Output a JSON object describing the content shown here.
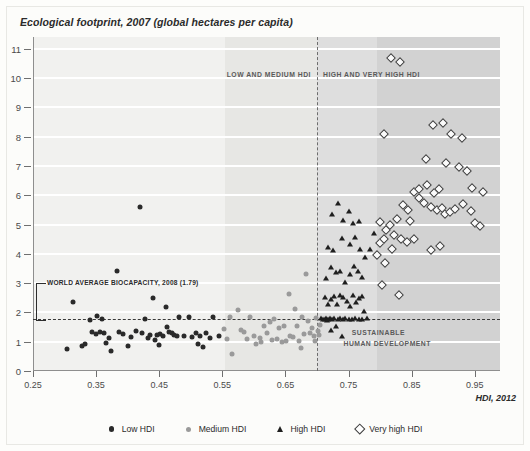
{
  "figure": {
    "title": "Ecological footprint, 2007 (global hectares per capita)",
    "xaxis_title": "HDI, 2012"
  },
  "annotations": {
    "low_medium_band": "LOW AND MEDIUM HDI",
    "high_veryhigh_band": "HIGH AND VERY HIGH HDI",
    "biocapacity": "WORLD AVERAGE BIOCAPACITY, 2008 (1.79)",
    "sustainable_line1": "SUSTAINABLE",
    "sustainable_line2": "HUMAN DEVELOPMENT"
  },
  "legend": [
    {
      "label": "Low HDI",
      "marker": "filled-circle-dark",
      "color": "#2a2a2a"
    },
    {
      "label": "Medium HDI",
      "marker": "filled-circle-gray",
      "color": "#9a9a9a"
    },
    {
      "label": "High HDI",
      "marker": "filled-triangle",
      "color": "#1f1f1f"
    },
    {
      "label": "Very high HDI",
      "marker": "open-diamond",
      "color": "#3c3c3c"
    }
  ],
  "chart_data": {
    "type": "scatter",
    "title": "Ecological footprint, 2007 (global hectares per capita)",
    "xlabel": "HDI, 2012",
    "ylabel": "Ecological footprint, 2007 (global hectares per capita)",
    "xlim": [
      0.25,
      0.99
    ],
    "ylim": [
      0,
      11.4
    ],
    "xticks": [
      0.25,
      0.35,
      0.45,
      0.55,
      0.65,
      0.75,
      0.85,
      0.95
    ],
    "xtick_labels": [
      "0.25",
      "0.35",
      "0.45",
      "0.55",
      "0.65",
      "0.75",
      "0.85",
      "0.95"
    ],
    "yticks": [
      0,
      1,
      2,
      3,
      4,
      5,
      6,
      7,
      8,
      9,
      10,
      11
    ],
    "ytick_labels": [
      "0",
      "1",
      "2",
      "3",
      "4",
      "5",
      "6",
      "7",
      "8",
      "9",
      "10",
      "11"
    ],
    "grid": "horizontal-white",
    "legend_position": "bottom-center",
    "reference_lines": [
      {
        "name": "world-average-biocapacity",
        "orientation": "horizontal",
        "value": 1.79,
        "label": "WORLD AVERAGE BIOCAPACITY, 2008 (1.79)",
        "style": "dashed"
      },
      {
        "name": "hdi-threshold",
        "orientation": "vertical",
        "value": 0.7,
        "label": "",
        "style": "dashed"
      }
    ],
    "shaded_bands": [
      {
        "name": "low-and-medium-hdi",
        "x_from": 0.555,
        "x_to": 0.7,
        "shade": "#e7e7e4"
      },
      {
        "name": "high-hdi",
        "x_from": 0.7,
        "x_to": 0.795,
        "shade": "#dedede"
      },
      {
        "name": "very-high-hdi",
        "x_from": 0.795,
        "x_to": 0.99,
        "shade": "#d2d2d2"
      }
    ],
    "series": [
      {
        "name": "Low HDI",
        "marker": "filled-circle-dark",
        "points": [
          [
            0.304,
            0.75
          ],
          [
            0.314,
            2.35
          ],
          [
            0.327,
            0.87
          ],
          [
            0.333,
            0.92
          ],
          [
            0.34,
            1.73
          ],
          [
            0.344,
            1.33
          ],
          [
            0.35,
            1.27
          ],
          [
            0.352,
            1.88
          ],
          [
            0.356,
            1.32
          ],
          [
            0.359,
            1.76
          ],
          [
            0.362,
            1.3
          ],
          [
            0.366,
            0.95
          ],
          [
            0.37,
            1.12
          ],
          [
            0.374,
            0.69
          ],
          [
            0.383,
            3.4
          ],
          [
            0.387,
            1.32
          ],
          [
            0.392,
            1.26
          ],
          [
            0.4,
            0.84
          ],
          [
            0.405,
            1.17
          ],
          [
            0.413,
            1.38
          ],
          [
            0.419,
            5.6
          ],
          [
            0.422,
            1.3
          ],
          [
            0.428,
            1.79
          ],
          [
            0.432,
            1.12
          ],
          [
            0.436,
            1.24
          ],
          [
            0.44,
            2.5
          ],
          [
            0.443,
            1.05
          ],
          [
            0.447,
            1.22
          ],
          [
            0.45,
            0.88
          ],
          [
            0.452,
            1.26
          ],
          [
            0.456,
            1.2
          ],
          [
            0.46,
            2.2
          ],
          [
            0.462,
            1.5
          ],
          [
            0.465,
            1.32
          ],
          [
            0.47,
            1.28
          ],
          [
            0.474,
            1.22
          ],
          [
            0.478,
            1.18
          ],
          [
            0.482,
            1.86
          ],
          [
            0.49,
            1.2
          ],
          [
            0.497,
            1.86
          ],
          [
            0.502,
            1.15
          ],
          [
            0.508,
            1.3
          ],
          [
            0.512,
            0.92
          ],
          [
            0.515,
            1.18
          ],
          [
            0.519,
            0.82
          ],
          [
            0.524,
            1.28
          ],
          [
            0.53,
            1.12
          ],
          [
            0.535,
            1.85
          ],
          [
            0.545,
            1.2
          ]
        ]
      },
      {
        "name": "Medium HDI",
        "marker": "filled-circle-gray",
        "points": [
          [
            0.552,
            1.45
          ],
          [
            0.558,
            1.1
          ],
          [
            0.562,
            1.85
          ],
          [
            0.566,
            0.57
          ],
          [
            0.575,
            2.08
          ],
          [
            0.58,
            1.4
          ],
          [
            0.584,
            1.32
          ],
          [
            0.589,
            1.1
          ],
          [
            0.594,
            1.84
          ],
          [
            0.6,
            1.2
          ],
          [
            0.604,
            0.93
          ],
          [
            0.609,
            1.12
          ],
          [
            0.612,
            1.0
          ],
          [
            0.616,
            1.55
          ],
          [
            0.62,
            1.3
          ],
          [
            0.625,
            1.66
          ],
          [
            0.629,
            1.05
          ],
          [
            0.632,
            1.78
          ],
          [
            0.636,
            1.08
          ],
          [
            0.64,
            1.48
          ],
          [
            0.644,
            0.98
          ],
          [
            0.647,
            1.55
          ],
          [
            0.651,
            1.02
          ],
          [
            0.655,
            2.62
          ],
          [
            0.658,
            1.2
          ],
          [
            0.662,
            1.15
          ],
          [
            0.665,
            2.1
          ],
          [
            0.668,
            1.52
          ],
          [
            0.671,
            1.02
          ],
          [
            0.674,
            0.78
          ],
          [
            0.677,
            1.84
          ],
          [
            0.68,
            1.26
          ],
          [
            0.683,
            3.3
          ],
          [
            0.686,
            1.7
          ],
          [
            0.689,
            1.28
          ],
          [
            0.692,
            1.46
          ],
          [
            0.695,
            1.18
          ],
          [
            0.697,
            1.02
          ],
          [
            0.699,
            1.8
          ],
          [
            0.701,
            1.36
          ],
          [
            0.703,
            1.24
          ],
          [
            0.705,
            1.58
          ]
        ]
      },
      {
        "name": "High HDI",
        "marker": "filled-triangle",
        "points": [
          [
            0.706,
            1.8
          ],
          [
            0.709,
            1.76
          ],
          [
            0.712,
            1.78
          ],
          [
            0.714,
            1.82
          ],
          [
            0.716,
            1.74
          ],
          [
            0.718,
            1.79
          ],
          [
            0.72,
            1.8
          ],
          [
            0.722,
            1.4
          ],
          [
            0.724,
            1.76
          ],
          [
            0.727,
            1.82
          ],
          [
            0.73,
            1.55
          ],
          [
            0.733,
            1.78
          ],
          [
            0.736,
            1.81
          ],
          [
            0.739,
            1.2
          ],
          [
            0.742,
            1.79
          ],
          [
            0.745,
            1.82
          ],
          [
            0.712,
            2.52
          ],
          [
            0.717,
            2.3
          ],
          [
            0.722,
            2.45
          ],
          [
            0.727,
            2.55
          ],
          [
            0.731,
            2.3
          ],
          [
            0.736,
            2.6
          ],
          [
            0.742,
            2.52
          ],
          [
            0.747,
            2.4
          ],
          [
            0.752,
            2.22
          ],
          [
            0.757,
            2.6
          ],
          [
            0.762,
            2.35
          ],
          [
            0.766,
            2.48
          ],
          [
            0.771,
            2.55
          ],
          [
            0.775,
            2.05
          ],
          [
            0.75,
            1.79
          ],
          [
            0.755,
            1.78
          ],
          [
            0.76,
            1.8
          ],
          [
            0.766,
            1.79
          ],
          [
            0.772,
            1.78
          ],
          [
            0.779,
            1.8
          ],
          [
            0.714,
            3.18
          ],
          [
            0.722,
            3.55
          ],
          [
            0.73,
            3.38
          ],
          [
            0.737,
            3.4
          ],
          [
            0.745,
            3.05
          ],
          [
            0.752,
            3.3
          ],
          [
            0.758,
            3.6
          ],
          [
            0.765,
            3.42
          ],
          [
            0.771,
            3.2
          ],
          [
            0.717,
            4.22
          ],
          [
            0.726,
            4.12
          ],
          [
            0.739,
            4.55
          ],
          [
            0.752,
            4.35
          ],
          [
            0.76,
            4.58
          ],
          [
            0.768,
            4.18
          ],
          [
            0.742,
            5.15
          ],
          [
            0.757,
            5.05
          ],
          [
            0.766,
            5.12
          ],
          [
            0.724,
            5.35
          ],
          [
            0.734,
            5.75
          ],
          [
            0.751,
            5.45
          ],
          [
            0.776,
            3.9
          ],
          [
            0.784,
            4.15
          ],
          [
            0.79,
            4.72
          ]
        ]
      },
      {
        "name": "Very high HDI",
        "marker": "open-diamond",
        "points": [
          [
            0.818,
            10.7
          ],
          [
            0.832,
            10.55
          ],
          [
            0.806,
            8.1
          ],
          [
            0.884,
            8.38
          ],
          [
            0.899,
            8.45
          ],
          [
            0.913,
            8.08
          ],
          [
            0.872,
            7.25
          ],
          [
            0.905,
            7.1
          ],
          [
            0.925,
            6.95
          ],
          [
            0.938,
            6.82
          ],
          [
            0.854,
            6.12
          ],
          [
            0.862,
            6.22
          ],
          [
            0.874,
            6.35
          ],
          [
            0.886,
            6.08
          ],
          [
            0.894,
            6.2
          ],
          [
            0.862,
            5.9
          ],
          [
            0.87,
            5.72
          ],
          [
            0.88,
            5.6
          ],
          [
            0.89,
            5.48
          ],
          [
            0.898,
            5.55
          ],
          [
            0.903,
            5.35
          ],
          [
            0.911,
            5.44
          ],
          [
            0.919,
            5.52
          ],
          [
            0.931,
            5.7
          ],
          [
            0.944,
            5.45
          ],
          [
            0.836,
            5.65
          ],
          [
            0.844,
            5.48
          ],
          [
            0.826,
            5.18
          ],
          [
            0.815,
            4.98
          ],
          [
            0.848,
            5.12
          ],
          [
            0.8,
            5.1
          ],
          [
            0.81,
            4.8
          ],
          [
            0.822,
            4.65
          ],
          [
            0.833,
            4.52
          ],
          [
            0.842,
            4.4
          ],
          [
            0.853,
            4.52
          ],
          [
            0.8,
            4.38
          ],
          [
            0.806,
            4.52
          ],
          [
            0.819,
            4.18
          ],
          [
            0.795,
            3.95
          ],
          [
            0.808,
            3.7
          ],
          [
            0.803,
            2.95
          ],
          [
            0.83,
            2.6
          ],
          [
            0.95,
            5.05
          ],
          [
            0.958,
            4.95
          ],
          [
            0.945,
            6.25
          ],
          [
            0.963,
            6.1
          ],
          [
            0.93,
            7.95
          ],
          [
            0.88,
            4.12
          ],
          [
            0.895,
            4.28
          ]
        ]
      }
    ]
  }
}
